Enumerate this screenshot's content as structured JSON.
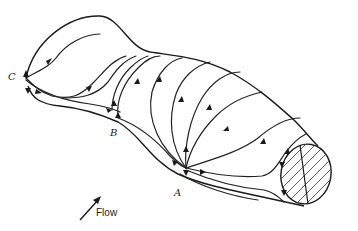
{
  "figure": {
    "points": {
      "a": "A",
      "b": "B",
      "c": "C"
    },
    "flow_label": "Flow",
    "colors": {
      "line": "#222222",
      "background": "#ffffff"
    }
  }
}
